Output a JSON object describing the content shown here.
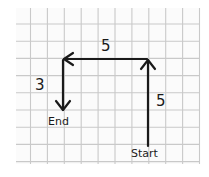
{
  "diagram": {
    "type": "grid-path",
    "colors": {
      "paper": "#fbfbfb",
      "grid": "#c9c9c9",
      "ink": "#1a1a1a"
    },
    "grid": {
      "columns": 11,
      "rows": 9
    },
    "start": {
      "label": "Start",
      "cell": [
        8,
        8
      ]
    },
    "end": {
      "label": "End",
      "cell": [
        3,
        6
      ]
    },
    "moves": [
      {
        "direction": "up",
        "steps": 5,
        "label": "5"
      },
      {
        "direction": "left",
        "steps": 5,
        "label": "5"
      },
      {
        "direction": "down",
        "steps": 3,
        "label": "3"
      }
    ]
  }
}
